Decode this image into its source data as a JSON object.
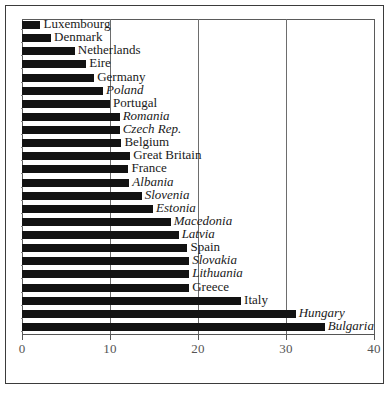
{
  "chart_data": {
    "type": "bar",
    "orientation": "horizontal",
    "title": "",
    "subtitle": "",
    "xlabel": "",
    "ylabel": "",
    "xlim": [
      0,
      40
    ],
    "ylim": null,
    "grid": true,
    "gridlines_x": [
      10,
      20,
      30
    ],
    "legend": null,
    "legend_position": "none",
    "xticks": [
      "0",
      "10",
      "20",
      "30",
      "40"
    ],
    "xtick_values": [
      0,
      10,
      20,
      30,
      40
    ],
    "bar_color": "#121212",
    "categories": [
      "Luxembourg",
      "Denmark",
      "Netherlands",
      "Eire",
      "Germany",
      "Poland",
      "Portugal",
      "Romania",
      "Czech Rep.",
      "Belgium",
      "Great Britain",
      "France",
      "Albania",
      "Slovenia",
      "Estonia",
      "Macedonia",
      "Latvia",
      "Spain",
      "Slovakia",
      "Lithuania",
      "Greece",
      "Italy",
      "Hungary",
      "Bulgaria"
    ],
    "values": [
      2.1,
      3.3,
      6.0,
      7.3,
      8.2,
      9.2,
      10.0,
      11.1,
      11.1,
      11.3,
      12.3,
      12.1,
      12.2,
      13.6,
      14.9,
      16.9,
      17.8,
      18.8,
      19.0,
      19.0,
      19.0,
      24.9,
      31.1,
      34.4
    ],
    "label_styles": [
      "regular",
      "regular",
      "regular",
      "regular",
      "regular",
      "italic",
      "regular",
      "italic",
      "italic",
      "regular",
      "regular",
      "regular",
      "italic",
      "italic",
      "italic",
      "italic",
      "italic",
      "regular",
      "italic",
      "italic",
      "regular",
      "regular",
      "italic",
      "italic"
    ]
  }
}
